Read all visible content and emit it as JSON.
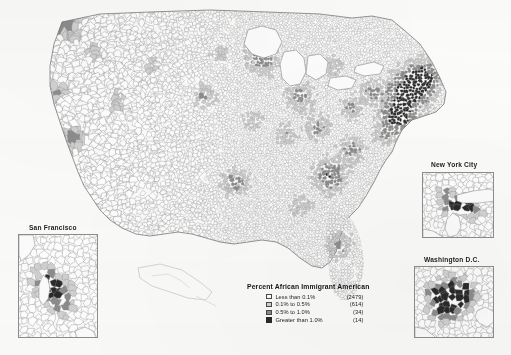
{
  "figure": {
    "background_color": "#fcfcfb",
    "boundary_color": "#8d8d8d"
  },
  "legend": {
    "title": "Percent African Immigrant American",
    "classes": [
      {
        "label": "Less than 0.1%",
        "count": "(2479)",
        "color": "#ffffff",
        "swatch": "sw0"
      },
      {
        "label": "0.1% to 0.5%",
        "count": "(614)",
        "color": "#d2d2d2",
        "swatch": "sw1"
      },
      {
        "label": "0.5% to 1.0%",
        "count": "(34)",
        "color": "#8d8d8d",
        "swatch": "sw2"
      },
      {
        "label": "Greater than 1.0%",
        "count": "(14)",
        "color": "#2a2a2a",
        "swatch": "sw3"
      }
    ]
  },
  "insets": {
    "san_francisco": {
      "label": "San Francisco"
    },
    "new_york_city": {
      "label": "New York City"
    },
    "washington_dc": {
      "label": "Washington D.C."
    }
  },
  "chart_data": {
    "type": "choropleth",
    "title": "Percent African Immigrant American",
    "geography": "United States counties",
    "variable": "Percent African Immigrant American",
    "projection": "albers-usa",
    "class_breaks": [
      0,
      0.1,
      0.5,
      1.0
    ],
    "classes": [
      {
        "label": "Less than 0.1%",
        "range": [
          0,
          0.1
        ],
        "count": 2479,
        "color": "#ffffff"
      },
      {
        "label": "0.1% to 0.5%",
        "range": [
          0.1,
          0.5
        ],
        "count": 614,
        "color": "#d2d2d2"
      },
      {
        "label": "0.5% to 1.0%",
        "range": [
          0.5,
          1.0
        ],
        "count": 34,
        "color": "#8d8d8d"
      },
      {
        "label": "Greater than 1.0%",
        "range": [
          1.0,
          null
        ],
        "count": 14,
        "color": "#2a2a2a"
      }
    ],
    "total_counties": 3141,
    "legend_position": "bottom-center",
    "grid": false,
    "insets": [
      "San Francisco",
      "New York City",
      "Washington D.C."
    ]
  }
}
